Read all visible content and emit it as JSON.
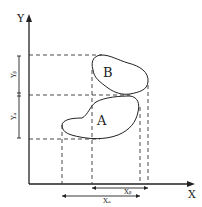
{
  "axes": {
    "x_label": "X",
    "y_label": "Y"
  },
  "regions": [
    {
      "label": "A"
    },
    {
      "label": "B"
    }
  ],
  "dimensions": {
    "x_a": "Xₐ",
    "x_b": "Xᵦ",
    "y_a": "Yₐ",
    "y_b": "Yᵦ"
  },
  "colors": {
    "line": "#222222",
    "background": "#ffffff"
  }
}
